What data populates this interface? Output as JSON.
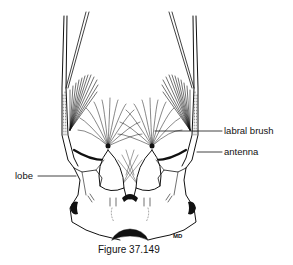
{
  "figure": {
    "caption": "Figure 37.149",
    "artist_initials": "MD",
    "labels": [
      {
        "id": "labral-brush",
        "text": "labral brush"
      },
      {
        "id": "antenna",
        "text": "antenna"
      },
      {
        "id": "lobe",
        "text": "lobe"
      }
    ],
    "colors": {
      "ink": "#111111",
      "background": "#ffffff"
    }
  }
}
